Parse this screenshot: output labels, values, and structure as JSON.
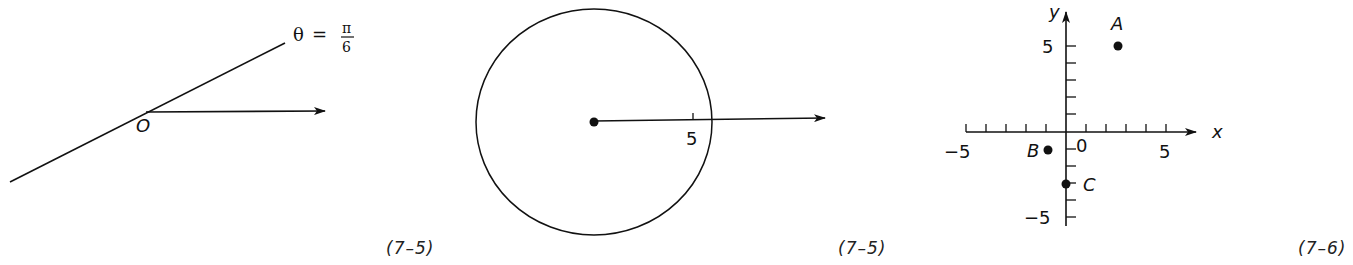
{
  "figures": [
    {
      "id": "polar-line",
      "caption": "(7–5)",
      "equation": {
        "theta": "θ",
        "equals": "=",
        "numerator": "π",
        "denominator": "6"
      },
      "origin_label": "O",
      "description": "Line θ = π/6 through pole O with polar axis"
    },
    {
      "id": "polar-circle",
      "caption": "(7–5)",
      "radius_label": "5",
      "description": "Circle r = 5 centered at pole with polar axis"
    },
    {
      "id": "cartesian-points",
      "caption": "(7–6)",
      "axis_labels": {
        "x": "x",
        "y": "y"
      },
      "tick_labels": {
        "x_neg": "−5",
        "x_zero": "0",
        "x_pos": "5",
        "y_pos": "5",
        "y_neg": "−5"
      },
      "points": [
        {
          "label": "A",
          "x": 2.6,
          "y": 5
        },
        {
          "label": "B",
          "x": -1,
          "y": -1
        },
        {
          "label": "C",
          "x": 0,
          "y": -3
        }
      ]
    }
  ],
  "colors": {
    "ink": "#111111",
    "background": "#ffffff"
  }
}
